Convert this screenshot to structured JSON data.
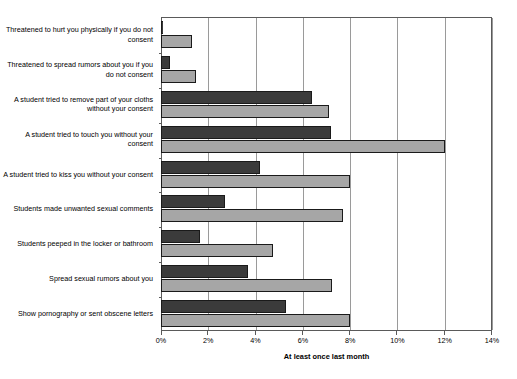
{
  "chart_data": {
    "type": "bar",
    "orientation": "horizontal",
    "title": "",
    "xlabel": "At least once last month",
    "ylabel": "",
    "xlim": [
      0,
      14
    ],
    "xticks": [
      0,
      2,
      4,
      6,
      8,
      10,
      12,
      14
    ],
    "xtick_labels": [
      "0%",
      "2%",
      "4%",
      "6%",
      "8%",
      "10%",
      "12%",
      "14%"
    ],
    "grid": true,
    "legend": null,
    "categories": [
      "Threatened to hurt you physically if you do not consent",
      "Threatened to spread rumors about you if you do not consent",
      "A student tried to remove part of your cloths without your consent",
      "A student tried to touch you without your consent",
      "A student tried to kiss you without your consent",
      "Students made unwanted sexual comments",
      "Students peeped in the locker or bathroom",
      "Spread sexual rumors about you",
      "Show pornography or sent obscene letters"
    ],
    "series": [
      {
        "name": "dark",
        "color": "#3b3b3b",
        "values": [
          0.0,
          0.4,
          6.4,
          7.2,
          4.2,
          2.7,
          1.65,
          3.7,
          5.3
        ]
      },
      {
        "name": "light",
        "color": "#a6a6a6",
        "values": [
          1.3,
          1.5,
          7.1,
          12.0,
          8.0,
          7.7,
          4.75,
          7.25,
          8.0
        ]
      }
    ]
  },
  "colors": {
    "dark_bar": "#3b3b3b",
    "light_bar": "#a6a6a6",
    "grid": "#9a9a9a",
    "frame": "#5a5a5a",
    "background": "#ffffff"
  }
}
